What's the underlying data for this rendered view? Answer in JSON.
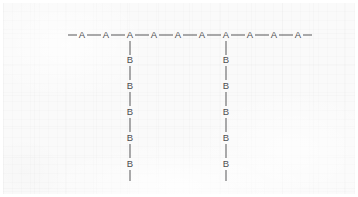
{
  "figure": {
    "kind": "graft-copolymer-structure",
    "background_color": "#fafafa",
    "ink_color": "#4e4e52",
    "bond_color": "#575759"
  },
  "backbone": {
    "label": "A",
    "unit_count": 10,
    "units": [
      {
        "label": "A",
        "x": 79,
        "y": 32
      },
      {
        "label": "A",
        "x": 103,
        "y": 32
      },
      {
        "label": "A",
        "x": 127,
        "y": 32
      },
      {
        "label": "A",
        "x": 151,
        "y": 32
      },
      {
        "label": "A",
        "x": 175,
        "y": 32
      },
      {
        "label": "A",
        "x": 199,
        "y": 32
      },
      {
        "label": "A",
        "x": 223,
        "y": 32
      },
      {
        "label": "A",
        "x": 247,
        "y": 32
      },
      {
        "label": "A",
        "x": 271,
        "y": 32
      },
      {
        "label": "A",
        "x": 295,
        "y": 32
      }
    ],
    "terminal_bond_left": {
      "x1": 65,
      "x2": 74,
      "y": 32
    },
    "terminal_bond_right": {
      "x1": 300,
      "x2": 309,
      "y": 32
    }
  },
  "branches": [
    {
      "name": "graft-branch-1",
      "label": "B",
      "unit_count": 5,
      "attach_x": 127,
      "units": [
        {
          "label": "B",
          "x": 127,
          "y": 57
        },
        {
          "label": "B",
          "x": 127,
          "y": 83
        },
        {
          "label": "B",
          "x": 127,
          "y": 109
        },
        {
          "label": "B",
          "x": 127,
          "y": 135
        },
        {
          "label": "B",
          "x": 127,
          "y": 161
        }
      ],
      "terminal_bond": {
        "y1": 167,
        "y2": 178
      }
    },
    {
      "name": "graft-branch-2",
      "label": "B",
      "unit_count": 5,
      "attach_x": 223,
      "units": [
        {
          "label": "B",
          "x": 223,
          "y": 57
        },
        {
          "label": "B",
          "x": 223,
          "y": 83
        },
        {
          "label": "B",
          "x": 223,
          "y": 109
        },
        {
          "label": "B",
          "x": 223,
          "y": 135
        },
        {
          "label": "B",
          "x": 223,
          "y": 161
        }
      ],
      "terminal_bond": {
        "y1": 167,
        "y2": 178
      }
    }
  ]
}
